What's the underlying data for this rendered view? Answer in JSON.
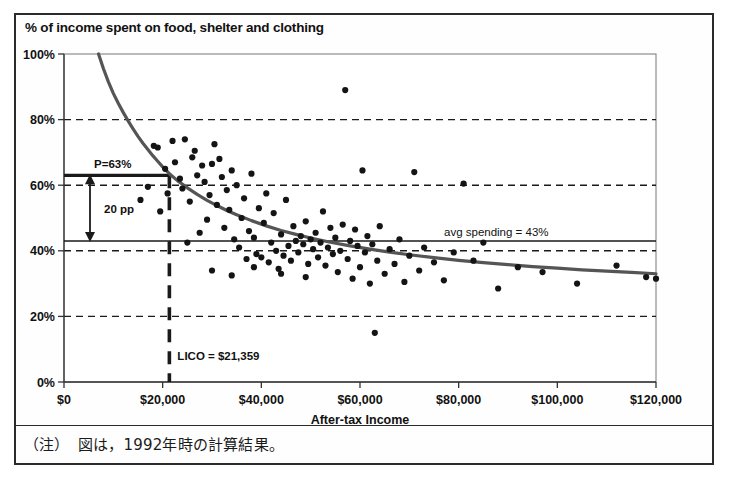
{
  "figure": {
    "note": "（注）　図は，1992年時の計算結果。"
  },
  "chart_data": {
    "type": "scatter",
    "title": "% of income spent on food, shelter and clothing",
    "xlabel": "After-tax Income",
    "ylabel": "",
    "xlim": [
      0,
      120000
    ],
    "ylim": [
      0,
      100
    ],
    "grid": "horizontal-dashed",
    "legend": "none",
    "xticks": [
      0,
      20000,
      40000,
      60000,
      80000,
      100000,
      120000
    ],
    "xticklabels": [
      "$0",
      "$20,000",
      "$40,000",
      "$60,000",
      "$80,000",
      "$100,000",
      "$120,000"
    ],
    "yticks": [
      0,
      20,
      40,
      60,
      80,
      100
    ],
    "yticklabels": [
      "0%",
      "20%",
      "40%",
      "60%",
      "80%",
      "100%"
    ],
    "annotations": [
      {
        "name": "p-threshold",
        "label": "P=63%",
        "value": 63,
        "kind": "horizontal-line",
        "style": "solid-thick"
      },
      {
        "name": "avg-spending",
        "label": "avg spending = 43%",
        "value": 43,
        "kind": "horizontal-line",
        "style": "solid"
      },
      {
        "name": "lico",
        "label": "LICO = $21,359",
        "value": 21359,
        "kind": "vertical-line",
        "style": "dashed-thick"
      },
      {
        "name": "gap",
        "label": "20 pp",
        "value": 20,
        "kind": "double-arrow",
        "from": 43,
        "to": 63
      }
    ],
    "series": [
      {
        "name": "fitted-curve",
        "type": "line",
        "points": [
          [
            7000,
            100
          ],
          [
            8000,
            95.5
          ],
          [
            9000,
            91.5
          ],
          [
            10000,
            88.0
          ],
          [
            11000,
            85.0
          ],
          [
            12000,
            82.2
          ],
          [
            13000,
            79.6
          ],
          [
            14000,
            77.2
          ],
          [
            15000,
            74.9
          ],
          [
            16000,
            72.8
          ],
          [
            17000,
            70.9
          ],
          [
            18000,
            69.0
          ],
          [
            19000,
            67.3
          ],
          [
            20000,
            65.6
          ],
          [
            21359,
            63.5
          ],
          [
            23000,
            61.4
          ],
          [
            25000,
            59.2
          ],
          [
            27000,
            57.2
          ],
          [
            29000,
            55.4
          ],
          [
            31000,
            53.8
          ],
          [
            33000,
            52.3
          ],
          [
            35000,
            51.0
          ],
          [
            38000,
            49.2
          ],
          [
            41000,
            47.6
          ],
          [
            44000,
            46.2
          ],
          [
            47000,
            45.0
          ],
          [
            50000,
            43.9
          ],
          [
            54000,
            42.6
          ],
          [
            58000,
            41.5
          ],
          [
            62000,
            40.5
          ],
          [
            66000,
            39.6
          ],
          [
            70000,
            38.8
          ],
          [
            75000,
            37.9
          ],
          [
            80000,
            37.1
          ],
          [
            85000,
            36.4
          ],
          [
            90000,
            35.8
          ],
          [
            95000,
            35.2
          ],
          [
            100000,
            34.7
          ],
          [
            105000,
            34.2
          ],
          [
            110000,
            33.8
          ],
          [
            115000,
            33.4
          ],
          [
            120000,
            33.0
          ]
        ]
      },
      {
        "name": "observations",
        "type": "scatter",
        "points": [
          [
            15500,
            55.5
          ],
          [
            17000,
            59.5
          ],
          [
            18200,
            72.0
          ],
          [
            19000,
            71.5
          ],
          [
            19500,
            52.0
          ],
          [
            20500,
            65.0
          ],
          [
            21000,
            57.5
          ],
          [
            22000,
            73.5
          ],
          [
            22500,
            67.0
          ],
          [
            23500,
            62.0
          ],
          [
            24000,
            59.0
          ],
          [
            24500,
            74.0
          ],
          [
            25500,
            55.0
          ],
          [
            26000,
            68.5
          ],
          [
            26500,
            70.5
          ],
          [
            27000,
            63.0
          ],
          [
            27500,
            45.5
          ],
          [
            28000,
            66.0
          ],
          [
            28500,
            61.0
          ],
          [
            29000,
            49.5
          ],
          [
            29500,
            57.0
          ],
          [
            30000,
            66.5
          ],
          [
            30500,
            72.5
          ],
          [
            31000,
            54.0
          ],
          [
            31500,
            68.0
          ],
          [
            32000,
            62.5
          ],
          [
            32500,
            47.0
          ],
          [
            33000,
            58.5
          ],
          [
            33500,
            52.5
          ],
          [
            34000,
            64.5
          ],
          [
            34500,
            43.5
          ],
          [
            35000,
            60.0
          ],
          [
            35500,
            41.0
          ],
          [
            36000,
            50.0
          ],
          [
            36500,
            56.0
          ],
          [
            37000,
            37.5
          ],
          [
            37500,
            46.0
          ],
          [
            38000,
            63.5
          ],
          [
            38500,
            44.0
          ],
          [
            39000,
            39.0
          ],
          [
            39500,
            53.0
          ],
          [
            40000,
            38.0
          ],
          [
            40500,
            48.5
          ],
          [
            41000,
            57.5
          ],
          [
            41500,
            36.5
          ],
          [
            42000,
            42.5
          ],
          [
            42500,
            51.5
          ],
          [
            43000,
            40.0
          ],
          [
            43500,
            34.5
          ],
          [
            44000,
            45.0
          ],
          [
            44500,
            38.5
          ],
          [
            45000,
            55.5
          ],
          [
            45500,
            41.5
          ],
          [
            46000,
            37.0
          ],
          [
            46500,
            47.5
          ],
          [
            47000,
            43.0
          ],
          [
            47500,
            39.5
          ],
          [
            48000,
            44.5
          ],
          [
            48500,
            42.0
          ],
          [
            49000,
            49.0
          ],
          [
            49500,
            36.0
          ],
          [
            50000,
            43.5
          ],
          [
            50500,
            40.5
          ],
          [
            51000,
            45.5
          ],
          [
            51500,
            38.0
          ],
          [
            52000,
            42.5
          ],
          [
            52500,
            52.0
          ],
          [
            53000,
            35.5
          ],
          [
            53500,
            41.0
          ],
          [
            54000,
            47.0
          ],
          [
            54500,
            39.0
          ],
          [
            55000,
            44.0
          ],
          [
            55500,
            33.5
          ],
          [
            56000,
            40.0
          ],
          [
            56500,
            48.0
          ],
          [
            57000,
            89.0
          ],
          [
            57500,
            37.5
          ],
          [
            58000,
            43.0
          ],
          [
            58500,
            31.5
          ],
          [
            59000,
            46.5
          ],
          [
            59500,
            41.5
          ],
          [
            60000,
            35.0
          ],
          [
            60500,
            64.5
          ],
          [
            61000,
            39.5
          ],
          [
            61500,
            44.5
          ],
          [
            62000,
            30.0
          ],
          [
            62500,
            42.0
          ],
          [
            63000,
            15.0
          ],
          [
            63500,
            37.0
          ],
          [
            64000,
            47.5
          ],
          [
            65000,
            33.0
          ],
          [
            66000,
            40.5
          ],
          [
            67000,
            36.0
          ],
          [
            68000,
            43.5
          ],
          [
            69000,
            30.5
          ],
          [
            70000,
            38.5
          ],
          [
            71000,
            64.0
          ],
          [
            72000,
            34.0
          ],
          [
            73000,
            41.0
          ],
          [
            75000,
            36.5
          ],
          [
            77000,
            31.0
          ],
          [
            79000,
            39.5
          ],
          [
            81000,
            60.5
          ],
          [
            83000,
            37.0
          ],
          [
            85000,
            42.5
          ],
          [
            88000,
            28.5
          ],
          [
            92000,
            35.0
          ],
          [
            97000,
            33.5
          ],
          [
            104000,
            30.0
          ],
          [
            112000,
            35.5
          ],
          [
            118000,
            32.0
          ],
          [
            120000,
            31.5
          ],
          [
            25000,
            42.5
          ],
          [
            30000,
            34.0
          ],
          [
            34000,
            32.5
          ],
          [
            38500,
            35.0
          ],
          [
            44000,
            33.0
          ],
          [
            49000,
            32.0
          ]
        ]
      }
    ]
  }
}
